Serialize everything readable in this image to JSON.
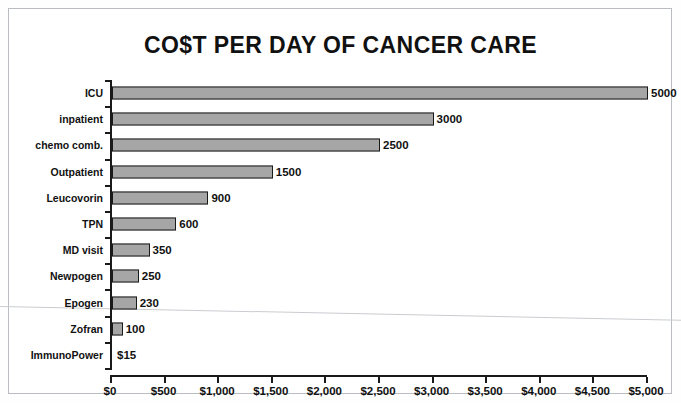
{
  "chart_data": {
    "type": "bar",
    "orientation": "horizontal",
    "title": "CO$T PER DAY OF CANCER CARE",
    "xlabel": "",
    "ylabel": "",
    "xlim": [
      0,
      5000
    ],
    "grid": false,
    "legend": null,
    "categories": [
      "ICU",
      "inpatient",
      "chemo comb.",
      "Outpatient",
      "Leucovorin",
      "TPN",
      "MD visit",
      "Newpogen",
      "Epogen",
      "Zofran",
      "ImmunoPower"
    ],
    "values": [
      5000,
      3000,
      2500,
      1500,
      900,
      600,
      350,
      250,
      230,
      100,
      15
    ],
    "value_labels": [
      "5000",
      "3000",
      "2500",
      "1500",
      "900",
      "600",
      "350",
      "250",
      "230",
      "100",
      "$15"
    ],
    "xticks": [
      0,
      500,
      1000,
      1500,
      2000,
      2500,
      3000,
      3500,
      4000,
      4500,
      5000
    ],
    "xtick_labels": [
      "$0",
      "$500",
      "$1,000",
      "$1,500",
      "$2,000",
      "$2,500",
      "$3,000",
      "$3,500",
      "$4,000",
      "$4,500",
      "$5,000"
    ],
    "colors": {
      "bar_fill": "#a6a6a6",
      "bar_border": "#1a1a1a",
      "axis": "#1a1a1a",
      "text": "#111111",
      "background": "#ffffff",
      "frame": "#b9bcc0"
    }
  }
}
